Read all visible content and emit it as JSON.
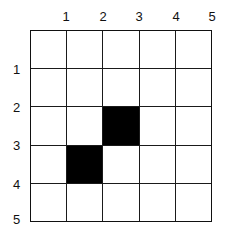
{
  "figure": {
    "title": "",
    "background_color": "#ffffff",
    "line_color": "#111111",
    "fill_color": "#000000"
  },
  "grid": {
    "rows": 5,
    "columns": 5,
    "column_labels": [
      "1",
      "2",
      "3",
      "4",
      "5"
    ],
    "row_labels": [
      "1",
      "2",
      "3",
      "4",
      "5"
    ],
    "filled_cells": [
      {
        "row": 3,
        "column": 3
      },
      {
        "row": 4,
        "column": 2
      }
    ],
    "cells": [
      [
        "empty",
        "empty",
        "empty",
        "empty",
        "empty"
      ],
      [
        "empty",
        "empty",
        "empty",
        "empty",
        "empty"
      ],
      [
        "empty",
        "empty",
        "filled",
        "empty",
        "empty"
      ],
      [
        "empty",
        "filled",
        "empty",
        "empty",
        "empty"
      ],
      [
        "empty",
        "empty",
        "empty",
        "empty",
        "empty"
      ]
    ]
  }
}
